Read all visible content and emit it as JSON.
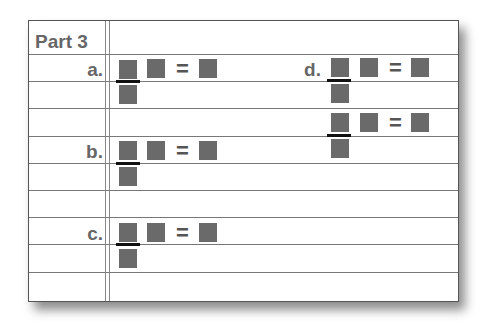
{
  "worksheet": {
    "title": "Part 3",
    "problems": [
      {
        "label": "a.",
        "equals": "="
      },
      {
        "label": "b.",
        "equals": "="
      },
      {
        "label": "c.",
        "equals": "="
      },
      {
        "label": "d.",
        "equals": "="
      },
      {
        "label": "",
        "equals": "="
      }
    ],
    "colors": {
      "box": "#6a6a6a",
      "line": "#777777",
      "text": "#666666"
    }
  }
}
